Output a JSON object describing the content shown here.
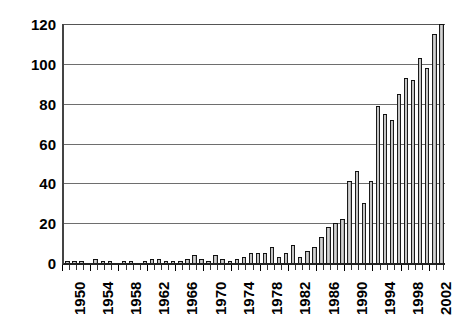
{
  "chart_data": {
    "type": "bar",
    "title": "",
    "subtitle": "",
    "xlabel": "",
    "ylabel": "",
    "xlim": [
      1950,
      2003
    ],
    "ylim": [
      0,
      120
    ],
    "ytick_labels": [
      "0",
      "20",
      "40",
      "60",
      "80",
      "100",
      "120"
    ],
    "ytick_values": [
      0,
      20,
      40,
      60,
      80,
      100,
      120
    ],
    "xtick_labels": [
      "1950",
      "1954",
      "1958",
      "1962",
      "1966",
      "1970",
      "1974",
      "1978",
      "1982",
      "1986",
      "1990",
      "1994",
      "1998",
      "2002"
    ],
    "xtick_values": [
      1950,
      1954,
      1958,
      1962,
      1966,
      1970,
      1974,
      1978,
      1982,
      1986,
      1990,
      1994,
      1998,
      2002
    ],
    "grid": true,
    "grid_axis": "y",
    "legend": false,
    "legend_position": "none",
    "bar_fill": "#d8d8d8",
    "bar_edge": "#1a1a1a",
    "grid_color": "#6e6e6e",
    "axis_color": "#222222",
    "background": "#ffffff",
    "categories": [
      1950,
      1951,
      1952,
      1953,
      1954,
      1955,
      1956,
      1957,
      1958,
      1959,
      1960,
      1961,
      1962,
      1963,
      1964,
      1965,
      1966,
      1967,
      1968,
      1969,
      1970,
      1971,
      1972,
      1973,
      1974,
      1975,
      1976,
      1977,
      1978,
      1979,
      1980,
      1981,
      1982,
      1983,
      1984,
      1985,
      1986,
      1987,
      1988,
      1989,
      1990,
      1991,
      1992,
      1993,
      1994,
      1995,
      1996,
      1997,
      1998,
      1999,
      2000,
      2001,
      2002,
      2003
    ],
    "values": [
      1,
      1,
      1,
      0,
      2,
      1,
      1,
      0,
      1,
      1,
      0,
      1,
      2,
      2,
      1,
      1,
      1,
      2,
      4,
      2,
      1,
      4,
      2,
      1,
      2,
      3,
      5,
      5,
      5,
      8,
      3,
      5,
      9,
      3,
      6,
      8,
      13,
      18,
      20,
      22,
      41,
      46,
      30,
      41,
      79,
      75,
      72,
      85,
      93,
      92,
      103,
      98,
      115,
      120
    ]
  },
  "meta": {
    "chart_name": "annual-counts-bar-chart"
  }
}
